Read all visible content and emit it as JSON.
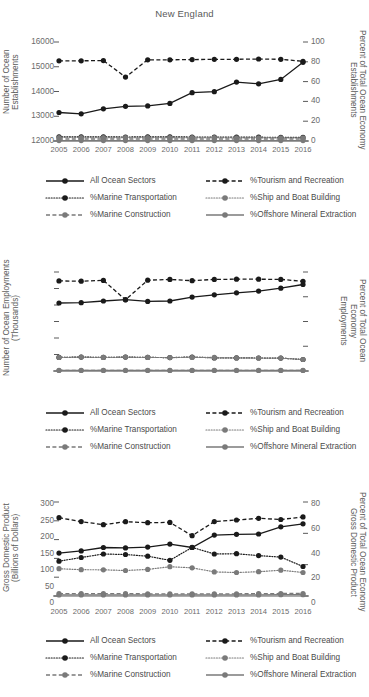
{
  "figure": {
    "title": "New England",
    "years": [
      "2005",
      "2006",
      "2007",
      "2008",
      "2009",
      "2010",
      "2011",
      "2012",
      "2013",
      "2014",
      "2015",
      "2016"
    ]
  },
  "series_names": {
    "all_ocean_sectors": "All Ocean Sectors",
    "tourism_recreation": "%Tourism and Recreation",
    "marine_transportation": "%Marine Transportation",
    "ship_boat_building": "%Ship and Boat Building",
    "marine_construction": "%Marine Construction",
    "offshore_mineral": "%Offshore Mineral Extraction"
  },
  "legend": {
    "rows": [
      [
        {
          "key": "all_ocean_sectors",
          "label": "All Ocean Sectors",
          "style": "solid",
          "color": "#1a1a1a"
        },
        {
          "key": "tourism_recreation",
          "label": "%Tourism and Recreation",
          "style": "dashed",
          "color": "#1a1a1a"
        }
      ],
      [
        {
          "key": "marine_transportation",
          "label": "%Marine Transportation",
          "style": "dotted",
          "color": "#1a1a1a"
        },
        {
          "key": "ship_boat_building",
          "label": "%Ship and Boat Building",
          "style": "dotted",
          "color": "#7a7a7a"
        }
      ],
      [
        {
          "key": "marine_construction",
          "label": "%Marine Construction",
          "style": "dashed",
          "color": "#7a7a7a"
        },
        {
          "key": "offshore_mineral",
          "label": "%Offshore Mineral Extraction",
          "style": "solid",
          "color": "#7a7a7a"
        }
      ]
    ]
  },
  "colors": {
    "black": "#1a1a1a",
    "gray": "#7a7a7a",
    "axis": "#5a5a5a",
    "text": "#4a4a4a"
  },
  "chart_data": [
    {
      "type": "line",
      "title": "New England",
      "xlabel": "",
      "ylabel": "Number of Ocean Establishments",
      "y2label": "Percent of Total Ocean Economy Establishments",
      "x": [
        "2005",
        "2006",
        "2007",
        "2008",
        "2009",
        "2010",
        "2011",
        "2012",
        "2013",
        "2014",
        "2015",
        "2016"
      ],
      "ylim": [
        12000,
        16000
      ],
      "yticks": [
        12000,
        13000,
        14000,
        15000,
        16000
      ],
      "y2lim": [
        0,
        100
      ],
      "y2ticks": [
        0,
        20,
        40,
        60,
        80,
        100
      ],
      "grid": false,
      "legend_position": "below",
      "series": [
        {
          "name": "All Ocean Sectors",
          "axis": "left",
          "style": "solid",
          "color": "#1a1a1a",
          "values": [
            13150,
            13100,
            13300,
            13400,
            13420,
            13520,
            13950,
            13990,
            14380,
            14310,
            14490,
            15180
          ]
        },
        {
          "name": "%Tourism and Recreation",
          "axis": "right",
          "style": "dashed",
          "color": "#1a1a1a",
          "values": [
            81,
            81,
            81.2,
            64.5,
            82,
            82,
            82.2,
            82.5,
            82.5,
            82.8,
            82.5,
            80.5
          ]
        },
        {
          "name": "%Marine Transportation",
          "axis": "right",
          "style": "dotted",
          "color": "#1a1a1a",
          "values": [
            4.2,
            4.2,
            4.1,
            4.0,
            4.1,
            4.1,
            4.0,
            3.9,
            3.9,
            3.8,
            3.7,
            3.6
          ]
        },
        {
          "name": "%Ship and Boat Building",
          "axis": "right",
          "style": "dotted",
          "color": "#7a7a7a",
          "values": [
            3.5,
            3.5,
            3.4,
            3.4,
            3.4,
            3.4,
            3.3,
            3.3,
            3.2,
            3.2,
            3.1,
            3.1
          ]
        },
        {
          "name": "%Marine Construction",
          "axis": "right",
          "style": "dashed",
          "color": "#7a7a7a",
          "values": [
            2.0,
            2.0,
            2.0,
            2.0,
            2.0,
            2.0,
            2.0,
            2.0,
            2.0,
            2.0,
            2.0,
            2.0
          ]
        },
        {
          "name": "%Offshore Mineral Extraction",
          "axis": "right",
          "style": "solid",
          "color": "#7a7a7a",
          "values": [
            0.4,
            0.4,
            0.4,
            0.4,
            0.4,
            0.4,
            0.4,
            0.4,
            0.4,
            0.4,
            0.4,
            0.4
          ]
        }
      ]
    },
    {
      "type": "line",
      "title": "",
      "xlabel": "",
      "ylabel": "Number of Ocean Employments (Thousands)",
      "y2label": "Percent of Total Ocean Economy Employments",
      "x": [
        "2005",
        "2006",
        "2007",
        "2008",
        "2009",
        "2010",
        "2011",
        "2012",
        "2013",
        "2014",
        "2015",
        "2016"
      ],
      "ylim": [
        0,
        300
      ],
      "yticks": [
        0,
        50,
        100,
        150,
        200,
        250,
        300
      ],
      "y2lim": [
        0,
        80
      ],
      "y2ticks": [
        0,
        20,
        40,
        60,
        80
      ],
      "grid": false,
      "legend_position": "below",
      "series": [
        {
          "name": "All Ocean Sectors",
          "axis": "left",
          "style": "solid",
          "color": "#1a1a1a",
          "values": [
            206,
            207,
            212,
            216,
            211,
            212,
            224,
            231,
            237,
            242,
            251,
            262
          ]
        },
        {
          "name": "%Tourism and Recreation",
          "axis": "right",
          "style": "dashed",
          "color": "#1a1a1a",
          "values": [
            72.8,
            72.6,
            73.2,
            57.5,
            73.4,
            74.0,
            73.0,
            74.0,
            74.2,
            74.2,
            74.0,
            72.5
          ]
        },
        {
          "name": "%Marine Transportation",
          "axis": "right",
          "style": "dotted",
          "color": "#1a1a1a",
          "values": [
            11.0,
            11.2,
            11.0,
            11.2,
            11.0,
            10.8,
            11.3,
            10.6,
            10.6,
            10.5,
            10.4,
            9.3
          ]
        },
        {
          "name": "%Ship and Boat Building",
          "axis": "right",
          "style": "dotted",
          "color": "#7a7a7a",
          "values": [
            11.0,
            11.2,
            11.0,
            11.2,
            11.0,
            10.8,
            11.0,
            11.0,
            10.6,
            10.5,
            10.4,
            9.3
          ]
        },
        {
          "name": "%Marine Construction",
          "axis": "right",
          "style": "dashed",
          "color": "#7a7a7a",
          "values": [
            0.6,
            0.6,
            0.6,
            0.6,
            0.6,
            0.6,
            0.6,
            0.6,
            0.6,
            0.6,
            0.6,
            0.6
          ]
        },
        {
          "name": "%Offshore Mineral Extraction",
          "axis": "right",
          "style": "solid",
          "color": "#7a7a7a",
          "values": [
            0.4,
            0.4,
            0.4,
            0.4,
            0.4,
            0.4,
            0.4,
            0.4,
            0.4,
            0.4,
            0.4,
            0.4
          ]
        }
      ]
    },
    {
      "type": "line",
      "title": "",
      "xlabel": "",
      "ylabel": "Gross Domestic Product (Billions of Dollars)",
      "y2label": "Percent of Total Ocean Economy Gross Domestic Product",
      "x": [
        "2005",
        "2006",
        "2007",
        "2008",
        "2009",
        "2010",
        "2011",
        "2012",
        "2013",
        "2014",
        "2015",
        "2016"
      ],
      "ylim": [
        0,
        25
      ],
      "yticks": [
        0,
        5,
        10,
        15,
        20,
        25
      ],
      "y2lim": [
        0,
        60
      ],
      "y2ticks": [
        0,
        20,
        40,
        60
      ],
      "grid": false,
      "legend_position": "below",
      "series": [
        {
          "name": "All Ocean Sectors",
          "axis": "left",
          "style": "solid",
          "color": "#1a1a1a",
          "values": [
            11.4,
            12.0,
            12.9,
            12.8,
            13.0,
            13.8,
            12.9,
            16.2,
            16.4,
            16.5,
            18.4,
            19.2
          ]
        },
        {
          "name": "%Tourism and Recreation",
          "axis": "right",
          "style": "dashed",
          "color": "#1a1a1a",
          "values": [
            50.0,
            47.5,
            45.5,
            47.4,
            46.8,
            47.0,
            38.5,
            47.5,
            48.5,
            49.6,
            48.8,
            50.5
          ]
        },
        {
          "name": "%Marine Transportation",
          "axis": "right",
          "style": "dotted",
          "color": "#1a1a1a",
          "values": [
            22.2,
            24.6,
            26.8,
            26.5,
            25.4,
            22.8,
            31.0,
            26.8,
            27.0,
            25.8,
            24.8,
            18.8
          ]
        },
        {
          "name": "%Ship and Boat Building",
          "axis": "right",
          "style": "dotted",
          "color": "#7a7a7a",
          "values": [
            17.4,
            16.8,
            16.7,
            16.3,
            17.0,
            18.7,
            18.0,
            15.4,
            15.0,
            15.5,
            16.5,
            15.0
          ]
        },
        {
          "name": "%Marine Construction",
          "axis": "right",
          "style": "dashed",
          "color": "#7a7a7a",
          "values": [
            1.5,
            1.5,
            1.5,
            1.5,
            1.4,
            1.4,
            1.4,
            1.4,
            1.4,
            1.5,
            1.6,
            1.6
          ]
        },
        {
          "name": "%Offshore Mineral Extraction",
          "axis": "right",
          "style": "solid",
          "color": "#7a7a7a",
          "values": [
            0.7,
            0.7,
            0.7,
            0.7,
            0.7,
            0.7,
            0.7,
            0.7,
            0.7,
            0.7,
            0.8,
            0.8
          ]
        }
      ]
    }
  ]
}
